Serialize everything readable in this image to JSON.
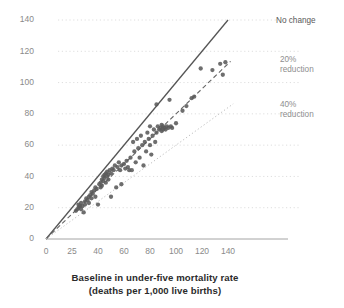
{
  "chart_data": {
    "type": "scatter",
    "title": "",
    "subtitle": "",
    "xlabel": "Baseline in under-five mortality rate",
    "xlabel_line2": "(deaths per 1,000 live births)",
    "ylabel": "",
    "xlim": [
      0,
      145
    ],
    "ylim": [
      0,
      145
    ],
    "xticks": [
      0,
      20,
      40,
      60,
      80,
      100,
      120,
      140
    ],
    "yticks": [
      0,
      20,
      40,
      60,
      80,
      100,
      120,
      140
    ],
    "xtick_labels": [
      "0",
      "25",
      "40",
      "60",
      "80",
      "100",
      "120",
      "140"
    ],
    "ytick_labels": [
      "0",
      "20",
      "40",
      "60",
      "80",
      "100",
      "120",
      "140"
    ],
    "grid": "horizontal-dotted",
    "legend_position": "right-inline-annotations",
    "colors": {
      "point": "#5a5a5a",
      "no_change_line": "#555555",
      "reduction_20_line": "#666666",
      "reduction_40_line": "#bdbdbd",
      "gridline": "#dedede",
      "axis": "#9a9a9a",
      "tick_label": "#8a8a8a",
      "annotation": "#8e8e8e",
      "annotation_dark": "#595959",
      "axis_title": "#2b2b2b"
    },
    "reference_lines": [
      {
        "name": "no-change",
        "label": "No change",
        "style": "solid",
        "slope": 1.0,
        "label_lines": [
          "No change"
        ]
      },
      {
        "name": "reduction-20",
        "label": "20% reduction",
        "style": "dashed",
        "slope": 0.8,
        "label_lines": [
          "20%",
          "reduction"
        ]
      },
      {
        "name": "reduction-40",
        "label": "40% reduction",
        "style": "dotted",
        "slope": 0.6,
        "label_lines": [
          "40%",
          "reduction"
        ]
      }
    ],
    "points": [
      [
        23,
        18
      ],
      [
        24,
        19
      ],
      [
        25,
        20
      ],
      [
        25,
        22
      ],
      [
        26,
        21
      ],
      [
        27,
        19
      ],
      [
        27,
        23
      ],
      [
        28,
        21
      ],
      [
        29,
        17
      ],
      [
        30,
        24
      ],
      [
        30,
        22
      ],
      [
        31,
        26
      ],
      [
        32,
        25
      ],
      [
        33,
        27
      ],
      [
        33,
        23
      ],
      [
        34,
        28
      ],
      [
        35,
        26
      ],
      [
        35,
        30
      ],
      [
        36,
        29
      ],
      [
        37,
        31
      ],
      [
        38,
        27
      ],
      [
        38,
        33
      ],
      [
        39,
        32
      ],
      [
        40,
        22
      ],
      [
        41,
        35
      ],
      [
        42,
        33
      ],
      [
        42,
        36
      ],
      [
        43,
        34
      ],
      [
        43,
        38
      ],
      [
        44,
        37
      ],
      [
        44,
        40
      ],
      [
        45,
        39
      ],
      [
        45,
        41
      ],
      [
        46,
        36
      ],
      [
        46,
        42
      ],
      [
        47,
        40
      ],
      [
        47,
        43
      ],
      [
        48,
        38
      ],
      [
        48,
        41
      ],
      [
        49,
        44
      ],
      [
        50,
        27
      ],
      [
        50,
        42
      ],
      [
        51,
        45
      ],
      [
        52,
        44
      ],
      [
        53,
        47
      ],
      [
        54,
        33
      ],
      [
        55,
        46
      ],
      [
        56,
        49
      ],
      [
        57,
        44
      ],
      [
        58,
        47
      ],
      [
        58,
        35
      ],
      [
        60,
        48
      ],
      [
        61,
        45
      ],
      [
        62,
        50
      ],
      [
        63,
        46
      ],
      [
        64,
        44
      ],
      [
        65,
        52
      ],
      [
        66,
        44
      ],
      [
        67,
        62
      ],
      [
        68,
        56
      ],
      [
        69,
        49
      ],
      [
        70,
        64
      ],
      [
        71,
        58
      ],
      [
        72,
        52
      ],
      [
        73,
        66
      ],
      [
        74,
        60
      ],
      [
        75,
        47
      ],
      [
        76,
        62
      ],
      [
        77,
        56
      ],
      [
        78,
        68
      ],
      [
        79,
        64
      ],
      [
        80,
        72
      ],
      [
        80,
        60
      ],
      [
        81,
        54
      ],
      [
        82,
        66
      ],
      [
        83,
        70
      ],
      [
        84,
        62
      ],
      [
        85,
        86
      ],
      [
        85,
        68
      ],
      [
        86,
        72
      ],
      [
        87,
        70
      ],
      [
        88,
        71
      ],
      [
        89,
        69
      ],
      [
        89,
        73
      ],
      [
        90,
        70
      ],
      [
        90,
        72
      ],
      [
        91,
        71
      ],
      [
        92,
        70
      ],
      [
        93,
        72
      ],
      [
        94,
        71
      ],
      [
        95,
        89
      ],
      [
        96,
        72
      ],
      [
        97,
        71
      ],
      [
        100,
        74
      ],
      [
        105,
        82
      ],
      [
        108,
        85
      ],
      [
        112,
        90
      ],
      [
        114,
        91
      ],
      [
        119,
        109
      ],
      [
        128,
        108
      ],
      [
        134,
        112
      ],
      [
        136,
        105
      ],
      [
        138,
        113
      ]
    ]
  },
  "annotations": {
    "no_change": "No change",
    "reduction_20_line1": "20%",
    "reduction_20_line2": "reduction",
    "reduction_40_line1": "40%",
    "reduction_40_line2": "reduction"
  }
}
